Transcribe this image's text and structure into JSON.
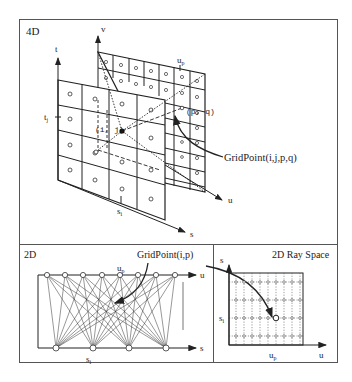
{
  "panels": {
    "four_d": {
      "label": "4D",
      "axes": {
        "t": "t",
        "v": "v",
        "s": "s",
        "u": "u"
      },
      "ticks": {
        "tj": "t",
        "tj_sub": "j",
        "si": "s",
        "si_sub": "i",
        "up": "u",
        "up_sub": "p"
      },
      "points": {
        "ij": "(i, j)",
        "pq": "(p, q)"
      },
      "callout": "GridPoint(i,j,p,q)"
    },
    "two_d": {
      "label": "2D",
      "axes": {
        "u": "u",
        "s": "s"
      },
      "ticks": {
        "up": "u",
        "up_sub": "p",
        "si": "s",
        "si_sub": "i"
      },
      "callout": "GridPoint(i,p)",
      "top_node_count": 8,
      "bottom_node_count": 4
    },
    "ray_space": {
      "label": "2D Ray Space",
      "axes": {
        "s": "s",
        "u": "u"
      },
      "ticks": {
        "si": "s",
        "si_sub": "i",
        "up": "u",
        "up_sub": "p"
      },
      "grid_columns": 9,
      "grid_rows": 4
    }
  },
  "colors": {
    "line": "#222222",
    "frame": "#555555",
    "grid": "#444444",
    "background": "#ffffff"
  }
}
